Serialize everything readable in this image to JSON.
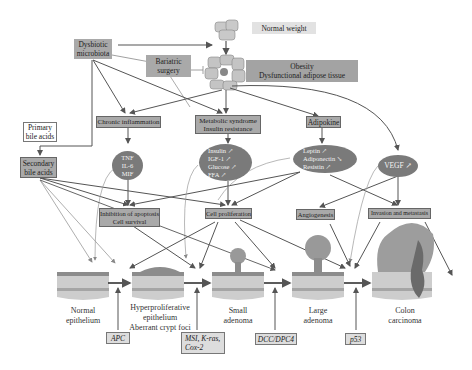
{
  "top": {
    "normal_weight": "Normal weight",
    "obesity_line1": "Obesity",
    "obesity_line2": "Dysfunctional adipose tissue",
    "dysbiotic_line1": "Dysbiotic",
    "dysbiotic_line2": "microbiota",
    "bariatric_line1": "Bariatric",
    "bariatric_line2": "surgery"
  },
  "bile": {
    "primary_line1": "Primary",
    "primary_line2": "bile acids",
    "secondary_line1": "Secondary",
    "secondary_line2": "bile acids"
  },
  "mid": {
    "chronic_inflammation": "Chronic inflammation",
    "metabolic_line1": "Metabolic syndrome",
    "metabolic_line2": "Insulin resistance",
    "adipokine": "Adipokine"
  },
  "ellipses": {
    "inflammation": [
      "TNF",
      "IL-6",
      "MIF"
    ],
    "metabolic": [
      "Insulin ↗",
      "IGF-1 ↗",
      "Glucose ↗",
      "FFA ↗"
    ],
    "adipokine": [
      "Leptin ↗",
      "Adiponectin ↘",
      "Resistin ↗"
    ],
    "vegf": "VEGF ↗"
  },
  "effects": {
    "apoptosis_line1": "Inhibition of apoptosis",
    "apoptosis_line2": "Cell survival",
    "proliferation": "Cell proliferation",
    "angiogenesis": "Angiogenesis",
    "invasion": "Invasion and metastasis"
  },
  "stages": [
    {
      "line1": "Normal",
      "line2": "epithelium",
      "line3": ""
    },
    {
      "line1": "Hyperproliferative",
      "line2": "epithelium",
      "line3": "Aberrant crypt foci"
    },
    {
      "line1": "Small",
      "line2": "adenoma",
      "line3": ""
    },
    {
      "line1": "Large",
      "line2": "adenoma",
      "line3": ""
    },
    {
      "line1": "Colon",
      "line2": "carcinoma",
      "line3": ""
    }
  ],
  "genes": {
    "apc": "APC",
    "msi_line1": "MSI, K-ras,",
    "msi_line2": "Cox-2",
    "dcc": "DCC/DPC4",
    "p53": "p53"
  },
  "colors": {
    "box_dark": "#a9a9a9",
    "ellipse": "#7a7a7a",
    "arrow": "#555555",
    "tissue_top": "#8c8c8c",
    "tissue_body": "#c8c8c8"
  }
}
